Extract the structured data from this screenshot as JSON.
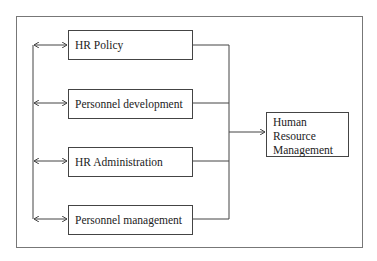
{
  "diagram": {
    "inputs": [
      {
        "label": "HR Policy"
      },
      {
        "label": "Personnel development"
      },
      {
        "label": "HR Administration"
      },
      {
        "label": "Personnel management"
      }
    ],
    "output": {
      "lines": [
        "Human",
        "Resource",
        "Management"
      ]
    },
    "colors": {
      "line": "#444444",
      "frame": "#777777",
      "background": "#ffffff"
    }
  }
}
